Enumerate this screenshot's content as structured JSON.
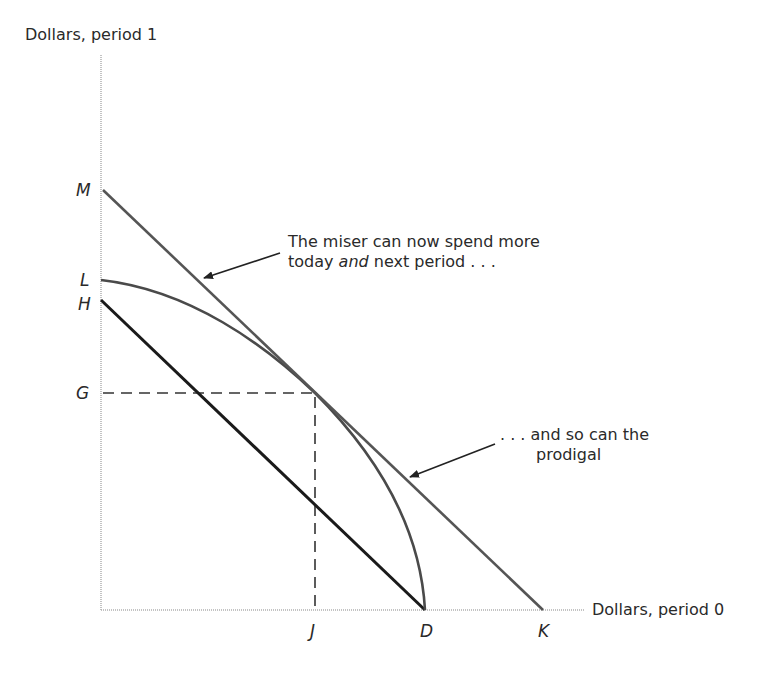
{
  "axes": {
    "y_label": "Dollars, period 1",
    "x_label": "Dollars, period 0"
  },
  "points": {
    "M": "M",
    "L": "L",
    "H": "H",
    "G": "G",
    "J": "J",
    "D": "D",
    "K": "K"
  },
  "annotations": {
    "miser_line1": "The miser can now spend more",
    "miser_line2_a": "today ",
    "miser_line2_em": "and",
    "miser_line2_b": " next period . . .",
    "prodigal_line1": ". . . and so can the",
    "prodigal_line2": "prodigal"
  },
  "colors": {
    "axis": "#b0b0b0",
    "market_line": "#555555",
    "budget_line": "#1a1a1a",
    "curve": "#4a4a4a",
    "dashed": "#333333"
  }
}
